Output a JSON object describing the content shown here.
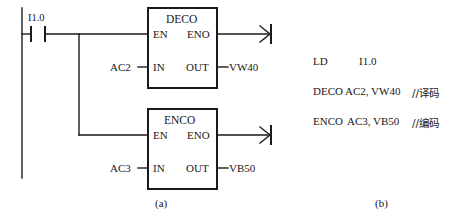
{
  "figure": {
    "caption_left": "(a)",
    "caption_right": "(b)"
  },
  "ladder": {
    "contact": {
      "label": "I1.0",
      "type": "normally-open-contact"
    },
    "blocks": [
      {
        "name": "DECO",
        "pins": {
          "en": "EN",
          "eno": "ENO",
          "in": "IN",
          "out": "OUT"
        },
        "input_operand": "AC2",
        "output_operand": "VW40"
      },
      {
        "name": "ENCO",
        "pins": {
          "en": "EN",
          "eno": "ENO",
          "in": "IN",
          "out": "OUT"
        },
        "input_operand": "AC3",
        "output_operand": "VB50"
      }
    ]
  },
  "stl": {
    "lines": [
      {
        "mnemonic": "LD",
        "operands": "I1.0",
        "comment": ""
      },
      {
        "mnemonic": "DECO",
        "operands": "AC2, VW40",
        "comment": "//译码"
      },
      {
        "mnemonic": "ENCO",
        "operands": "AC3, VB50",
        "comment": "//编码"
      }
    ]
  },
  "colors": {
    "background": "#ffffff",
    "line": "#1a1a1a",
    "text": "#171717"
  }
}
